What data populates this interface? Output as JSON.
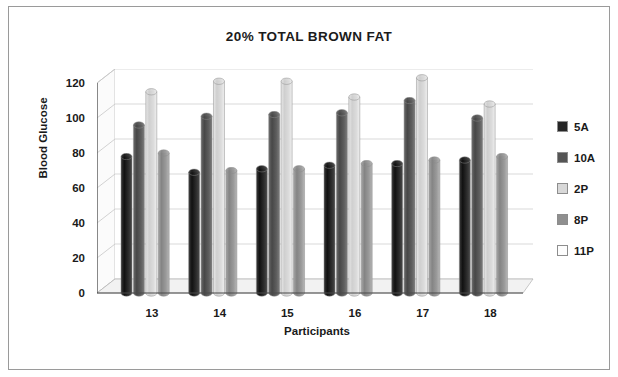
{
  "chart_data": {
    "type": "bar",
    "title": "20% TOTAL BROWN FAT",
    "xlabel": "Participants",
    "ylabel": "Blood Glucose",
    "categories": [
      "13",
      "14",
      "15",
      "16",
      "17",
      "18"
    ],
    "yticks": [
      0,
      20,
      40,
      60,
      80,
      100,
      120
    ],
    "ylim": [
      0,
      120
    ],
    "grid": true,
    "legend_position": "right",
    "style": "3d-cylinder",
    "series": [
      {
        "name": "5A",
        "color": "#262626",
        "values": [
          78,
          69,
          71,
          73,
          74,
          76
        ]
      },
      {
        "name": "10A",
        "color": "#555555",
        "values": [
          96,
          101,
          102,
          103,
          110,
          100
        ]
      },
      {
        "name": "2P",
        "color": "#d8d8d8",
        "values": [
          115,
          121,
          121,
          112,
          123,
          108
        ]
      },
      {
        "name": "8P",
        "color": "#8f8f8f",
        "values": [
          80,
          70,
          71,
          74,
          76,
          78
        ]
      },
      {
        "name": "11P",
        "color": "#fdfdfd",
        "values": [
          0,
          0,
          0,
          0,
          0,
          0
        ]
      }
    ]
  },
  "legend": {
    "items": [
      {
        "label": "5A"
      },
      {
        "label": "10A"
      },
      {
        "label": "2P"
      },
      {
        "label": "8P"
      },
      {
        "label": "11P"
      }
    ]
  }
}
